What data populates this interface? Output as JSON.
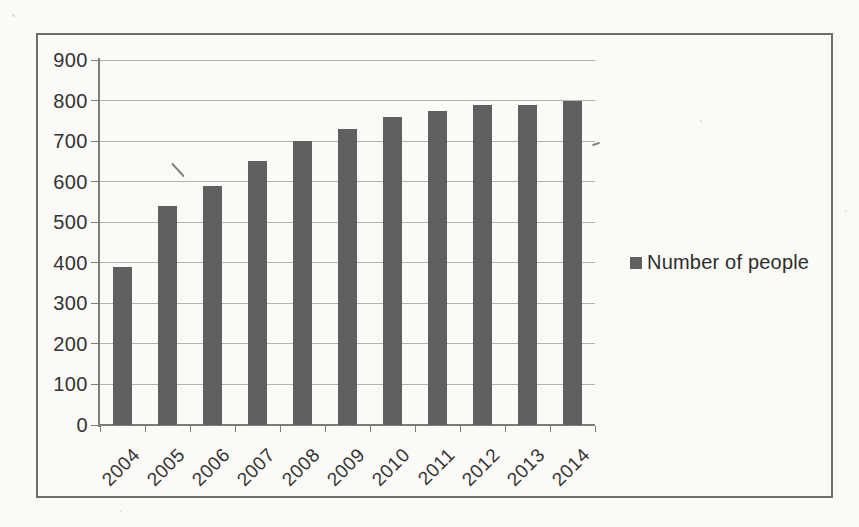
{
  "chart_data": {
    "type": "bar",
    "title": "",
    "xlabel": "",
    "ylabel": "",
    "categories": [
      "2004",
      "2005",
      "2006",
      "2007",
      "2008",
      "2009",
      "2010",
      "2011",
      "2012",
      "2013",
      "2014"
    ],
    "series": [
      {
        "name": "Number of people",
        "values": [
          390,
          540,
          590,
          650,
          700,
          730,
          760,
          775,
          790,
          790,
          800
        ]
      }
    ],
    "ylim": [
      0,
      900
    ],
    "yticks": [
      0,
      100,
      200,
      300,
      400,
      500,
      600,
      700,
      800,
      900
    ],
    "grid": true,
    "legend_position": "right",
    "colors": {
      "bar": "#606060",
      "gridline": "#a5a5a5",
      "axis": "#7c7c7c",
      "text": "#333333",
      "frame_border": "#6e6e6e",
      "paper": "#fbfaf7"
    }
  },
  "legend": {
    "label": "Number of people",
    "marker": "dark-square"
  }
}
